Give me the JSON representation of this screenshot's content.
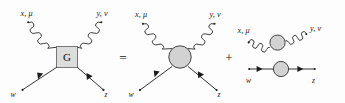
{
  "figure": {
    "kind": "feynman-diagram-equation",
    "background_color": "#fdfdfd",
    "line_color": "#1c1c1c",
    "blob_fill": "#d2d2d2",
    "box_fill": "#dcdcdc"
  },
  "operators": {
    "equals": "=",
    "plus": "+"
  },
  "term_box": {
    "name": "four-point-vertex-box",
    "vertex_label": "G",
    "labels": {
      "top_left": "x, μ",
      "top_right": "y, ν",
      "bottom_left": "w",
      "bottom_right": "z"
    },
    "legs": [
      {
        "name": "photon-leg-top-left",
        "type": "wavy",
        "label": "x, μ"
      },
      {
        "name": "photon-leg-top-right",
        "type": "wavy",
        "label": "y, ν"
      },
      {
        "name": "fermion-leg-bottom-left",
        "type": "straight-arrow",
        "label": "w"
      },
      {
        "name": "fermion-leg-bottom-right",
        "type": "straight-arrow",
        "label": "z"
      }
    ]
  },
  "term_blob": {
    "name": "connected-blob-vertex",
    "labels": {
      "top_left": "x, μ",
      "top_right": "y, ν",
      "bottom_left": "w",
      "bottom_right": "z"
    },
    "legs": [
      {
        "name": "photon-leg-top-left",
        "type": "wavy",
        "label": "x, μ"
      },
      {
        "name": "photon-leg-top-right",
        "type": "wavy",
        "label": "y, ν"
      },
      {
        "name": "fermion-leg-bottom-left",
        "type": "straight-arrow",
        "label": "w"
      },
      {
        "name": "fermion-leg-bottom-right",
        "type": "straight-arrow",
        "label": "z"
      }
    ]
  },
  "term_propagators": {
    "name": "disconnected-propagator-product",
    "photon_propagator": {
      "name": "photon-propagator",
      "type": "wavy",
      "left_label": "x, μ",
      "right_label": "y, ν"
    },
    "fermion_propagator": {
      "name": "fermion-propagator",
      "type": "straight-arrow",
      "left_label": "w",
      "right_label": "z"
    }
  }
}
